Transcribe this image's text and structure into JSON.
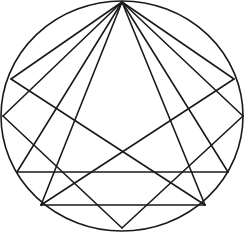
{
  "figure": {
    "canvas": {
      "width": 248,
      "height": 233
    },
    "colors": {
      "stroke": "#1a1a1a",
      "background": "#ffffff"
    },
    "stroke_width": 1.6,
    "circle": {
      "label": "circumscribing-circle",
      "center_x": 122,
      "center_y": 116,
      "radius_x": 121,
      "radius_y": 115
    },
    "vertices": [
      {
        "id": "apex",
        "label": "top-apex",
        "x": 122,
        "y": 2
      },
      {
        "id": "upper_left",
        "label": "upper-left-vertex",
        "x": 11,
        "y": 79
      },
      {
        "id": "upper_right",
        "label": "upper-right-vertex",
        "x": 234,
        "y": 79
      },
      {
        "id": "mid_left",
        "label": "mid-left-vertex",
        "x": 3,
        "y": 116
      },
      {
        "id": "mid_right",
        "label": "mid-right-vertex",
        "x": 243,
        "y": 116
      },
      {
        "id": "base_left",
        "label": "base-left-vertex",
        "x": 17,
        "y": 172
      },
      {
        "id": "base_right",
        "label": "base-right-vertex",
        "x": 228,
        "y": 172
      },
      {
        "id": "low_left",
        "label": "lower-left-vertex",
        "x": 41,
        "y": 205
      },
      {
        "id": "low_right",
        "label": "lower-right-vertex",
        "x": 205,
        "y": 205
      },
      {
        "id": "bottom",
        "label": "bottom-vertex",
        "x": 122,
        "y": 228
      }
    ],
    "chords": [
      {
        "id": "apex-to-upper-left",
        "label": "chord-apex-upper-left",
        "x1": 122,
        "y1": 2,
        "x2": 11,
        "y2": 79
      },
      {
        "id": "apex-to-upper-right",
        "label": "chord-apex-upper-right",
        "x1": 122,
        "y1": 2,
        "x2": 234,
        "y2": 79
      },
      {
        "id": "apex-to-mid-left",
        "label": "chord-apex-mid-left",
        "x1": 122,
        "y1": 2,
        "x2": 3,
        "y2": 116
      },
      {
        "id": "apex-to-mid-right",
        "label": "chord-apex-mid-right",
        "x1": 122,
        "y1": 2,
        "x2": 243,
        "y2": 116
      },
      {
        "id": "apex-to-base-left",
        "label": "chord-apex-base-left",
        "x1": 122,
        "y1": 2,
        "x2": 17,
        "y2": 172
      },
      {
        "id": "apex-to-base-right",
        "label": "chord-apex-base-right",
        "x1": 122,
        "y1": 2,
        "x2": 228,
        "y2": 172
      },
      {
        "id": "apex-to-low-left",
        "label": "chord-apex-low-left",
        "x1": 122,
        "y1": 2,
        "x2": 41,
        "y2": 205
      },
      {
        "id": "apex-to-low-right",
        "label": "chord-apex-low-right",
        "x1": 122,
        "y1": 2,
        "x2": 205,
        "y2": 205
      },
      {
        "id": "upper-left-to-low-right",
        "label": "chord-upper-left-low-right",
        "x1": 11,
        "y1": 79,
        "x2": 205,
        "y2": 205
      },
      {
        "id": "upper-right-to-low-left",
        "label": "chord-upper-right-low-left",
        "x1": 234,
        "y1": 79,
        "x2": 41,
        "y2": 205
      },
      {
        "id": "mid-left-to-bottom",
        "label": "chord-mid-left-bottom",
        "x1": 3,
        "y1": 116,
        "x2": 122,
        "y2": 228
      },
      {
        "id": "mid-right-to-bottom",
        "label": "chord-mid-right-bottom",
        "x1": 243,
        "y1": 116,
        "x2": 122,
        "y2": 228
      },
      {
        "id": "base-horizontal",
        "label": "chord-base-horizontal",
        "x1": 17,
        "y1": 172,
        "x2": 228,
        "y2": 172
      },
      {
        "id": "lower-horizontal",
        "label": "chord-lower-horizontal",
        "x1": 41,
        "y1": 205,
        "x2": 205,
        "y2": 205
      }
    ]
  }
}
